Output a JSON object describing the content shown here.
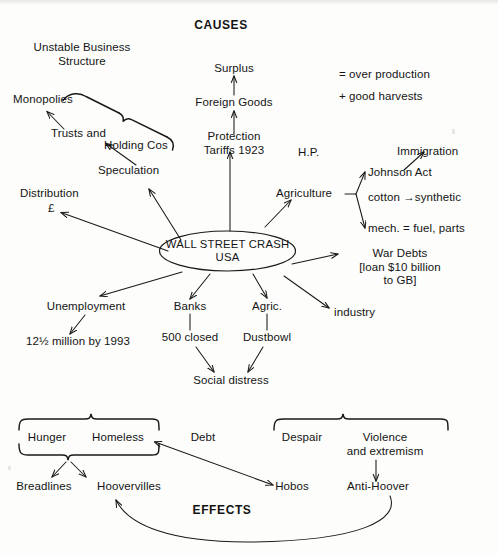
{
  "diagram": {
    "title_top": "CAUSES",
    "title_bottom": "EFFECTS",
    "center": {
      "line1": "WALL STREET CRASH",
      "line2": "USA"
    },
    "causes": {
      "unstable_business": "Unstable Business\nStructure",
      "monopolies": "Monopolies",
      "trusts_and": "Trusts and",
      "holding_cos": "Holding Cos",
      "speculation": "Speculation",
      "distribution": "Distribution",
      "pound": "£",
      "surplus": "Surplus",
      "foreign_goods": "Foreign Goods",
      "protection_tariffs": "Protection\nTariffs 1923",
      "hp": "H.P.",
      "legend_over_production": "= over production",
      "legend_good_harvests": "+ good harvests",
      "agriculture": "Agriculture",
      "immigration": "Immigration",
      "johnson_act": "Johnson Act",
      "cotton_synthetic": "cotton →synthetic",
      "mech": "mech. = fuel, parts",
      "war_debts": "War Debts\n[loan $10 billion\nto GB]",
      "industry": "industry"
    },
    "consequences": {
      "unemployment": "Unemployment",
      "unemployment_detail": "12½ million by 1993",
      "banks": "Banks",
      "banks_detail": "500 closed",
      "agric": "Agric.",
      "agric_detail": "Dustbowl",
      "social_distress": "Social distress"
    },
    "effects": {
      "left_group": [
        "Hunger",
        "Homeless",
        "Debt"
      ],
      "right_group": [
        "Despair",
        "Violence\nand extremism"
      ],
      "breadlines": "Breadlines",
      "hoovervilles": "Hoovervilles",
      "hobos": "Hobos",
      "anti_hoover": "Anti-Hoover"
    },
    "colors": {
      "ink": "#141414",
      "paper": "#fdfdfc",
      "stroke": "#1a1a1a"
    }
  }
}
